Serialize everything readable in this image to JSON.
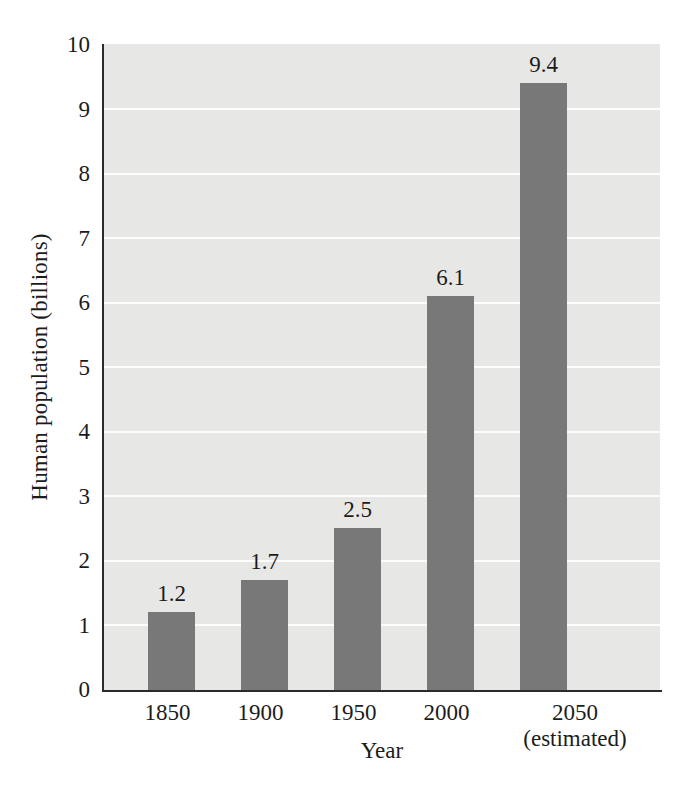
{
  "chart_data": {
    "type": "bar",
    "title": "",
    "subtitle": "",
    "xlabel": "Year",
    "ylabel": "Human population (billions)",
    "categories": [
      "1850",
      "1900",
      "1950",
      "2000",
      "2050"
    ],
    "category_sublabels": [
      "",
      "",
      "",
      "",
      "(estimated)"
    ],
    "values": [
      1.2,
      1.7,
      2.5,
      6.1,
      9.4
    ],
    "value_labels": [
      "1.2",
      "1.7",
      "2.5",
      "6.1",
      "9.4"
    ],
    "ylim": [
      0,
      10
    ],
    "ytick_labels": [
      "0",
      "1",
      "2",
      "3",
      "4",
      "5",
      "6",
      "7",
      "8",
      "9",
      "10"
    ],
    "ytick_values": [
      0,
      1,
      2,
      3,
      4,
      5,
      6,
      7,
      8,
      9,
      10
    ],
    "xlim_note": "categorical",
    "grid": "horizontal gridlines at each y tick, white on light gray panel",
    "legend": "none",
    "legend_position": "none",
    "colors": {
      "bar": "#787878",
      "panel_background": "#e7e7e6",
      "gridline": "#fdfdfd",
      "axis": "#2b2b2b",
      "text": "#1c1c1c",
      "figure_background": "#ffffff"
    }
  }
}
